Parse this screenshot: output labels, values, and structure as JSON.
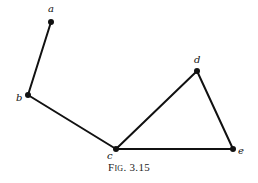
{
  "figure": {
    "caption_prefix": "Fig.",
    "caption_number": "3.15",
    "line_color": "#111111",
    "nodes": [
      {
        "id": "a",
        "label": "a",
        "x": 51,
        "y": 22,
        "lx": 48,
        "ly": 12
      },
      {
        "id": "b",
        "label": "b",
        "x": 28,
        "y": 95,
        "lx": 16,
        "ly": 101
      },
      {
        "id": "c",
        "label": "c",
        "x": 116,
        "y": 149,
        "lx": 107,
        "ly": 159
      },
      {
        "id": "d",
        "label": "d",
        "x": 197,
        "y": 71,
        "lx": 194,
        "ly": 63
      },
      {
        "id": "e",
        "label": "e",
        "x": 233,
        "y": 149,
        "lx": 238,
        "ly": 154
      }
    ],
    "edges": [
      [
        "a",
        "b"
      ],
      [
        "b",
        "c"
      ],
      [
        "c",
        "d"
      ],
      [
        "c",
        "e"
      ],
      [
        "d",
        "e"
      ]
    ]
  }
}
